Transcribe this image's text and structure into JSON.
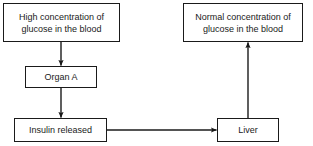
{
  "diagram": {
    "type": "flowchart",
    "background_color": "#ffffff",
    "line_color": "#1a1a1a",
    "text_color": "#1a1a1a",
    "nodes": [
      {
        "id": "high-glucose",
        "label": "High concentration of\nglucose in the blood",
        "shape": "rectangle"
      },
      {
        "id": "normal-glucose",
        "label": "Normal concentration of\nglucose in the blood",
        "shape": "rectangle"
      },
      {
        "id": "organ-a",
        "label": "Organ A",
        "shape": "rectangle"
      },
      {
        "id": "insulin-released",
        "label": "Insulin released",
        "shape": "rectangle"
      },
      {
        "id": "liver",
        "label": "Liver",
        "shape": "rectangle"
      }
    ],
    "edges": [
      {
        "id": "edge-high-glucose-to-organ-a",
        "from": "high-glucose",
        "to": "organ-a",
        "direction": "down",
        "label": ""
      },
      {
        "id": "edge-organ-a-to-insulin",
        "from": "organ-a",
        "to": "insulin-released",
        "direction": "down",
        "label": ""
      },
      {
        "id": "edge-insulin-to-liver",
        "from": "insulin-released",
        "to": "liver",
        "direction": "right",
        "label": ""
      },
      {
        "id": "edge-liver-to-normal-glucose",
        "from": "liver",
        "to": "normal-glucose",
        "direction": "up",
        "label": ""
      }
    ]
  }
}
